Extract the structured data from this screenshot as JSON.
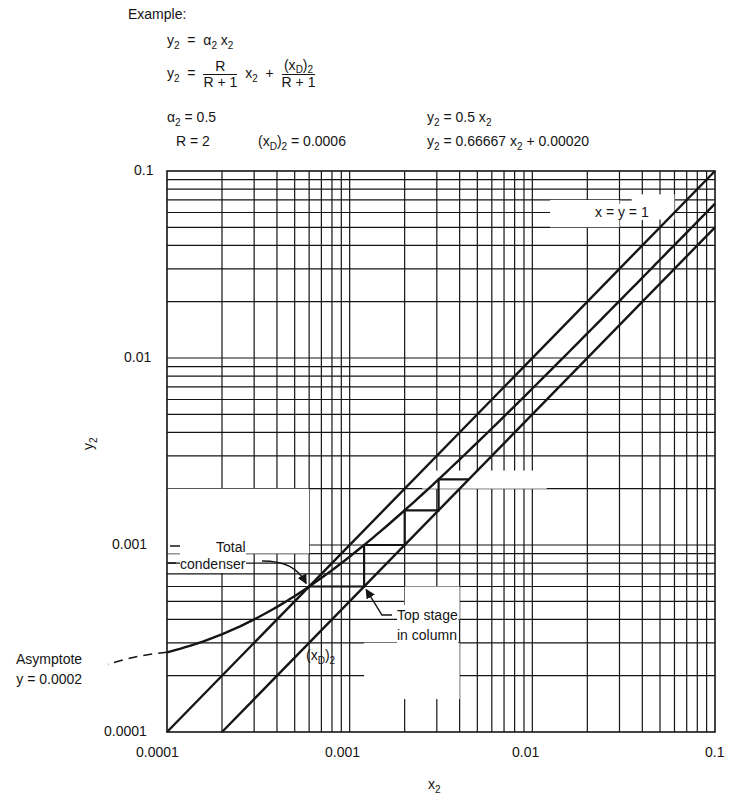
{
  "header": {
    "example_label": "Example:",
    "eq1": {
      "lhs": "y",
      "lhs_sub": "2",
      "eq": "=",
      "alpha": "α",
      "alpha_sub": "2",
      "x": "x",
      "x_sub": "2"
    },
    "eq2": {
      "lhs": "y",
      "lhs_sub": "2",
      "eq": "=",
      "frac1_num": "R",
      "frac1_den": "R + 1",
      "x": "x",
      "x_sub": "2",
      "plus": "+",
      "frac2_num_a": "(x",
      "frac2_num_sub": "D",
      "frac2_num_b": ")",
      "frac2_num_sub2": "2",
      "frac2_den": "R + 1"
    },
    "params": {
      "alpha_label": "α",
      "alpha_sub": "2",
      "alpha_value": "= 0.5",
      "r_text": "R  =  2",
      "xd_a": "(x",
      "xd_sub": "D",
      "xd_b": ")",
      "xd_sub2": "2",
      "xd_value": "= 0.0006"
    },
    "results": {
      "line1_lhs": "y",
      "line1_sub": "2",
      "line1_rhs": "= 0.5  x",
      "line1_rhs_sub": "2",
      "line2_lhs": "y",
      "line2_sub": "2",
      "line2_rhs": "= 0.66667  x",
      "line2_rhs_sub": "2",
      "line2_tail": " + 0.00020"
    }
  },
  "chart_data": {
    "type": "line",
    "title": "",
    "xlabel": "x2",
    "ylabel": "y2",
    "xscale": "log",
    "yscale": "log",
    "xlim": [
      0.0001,
      0.1
    ],
    "ylim": [
      0.0001,
      0.1
    ],
    "grid": true,
    "x_ticks": [
      "0.0001",
      "0.001",
      "0.01",
      "0.1"
    ],
    "y_ticks": [
      "0.0001",
      "0.001",
      "0.01",
      "0.1"
    ],
    "series": [
      {
        "name": "x = y = 1",
        "kind": "diagonal",
        "points": [
          [
            0.0001,
            0.0001
          ],
          [
            0.1,
            0.1
          ]
        ]
      },
      {
        "name": "Operating line y2 = 0.66667 x2 + 0.00020",
        "kind": "operating",
        "slope": 0.66667,
        "intercept": 0.0002,
        "x_range": [
          0.0001,
          0.1
        ]
      },
      {
        "name": "Equilibrium y2 = 0.5 x2",
        "kind": "equilibrium",
        "points": [
          [
            0.0002,
            0.0001
          ],
          [
            0.1,
            0.05
          ]
        ]
      },
      {
        "name": "Stages",
        "kind": "staircase",
        "points": [
          [
            0.0006,
            0.0006
          ],
          [
            0.0012,
            0.0006
          ],
          [
            0.0012,
            0.001
          ],
          [
            0.002,
            0.001
          ],
          [
            0.002,
            0.001533
          ],
          [
            0.003067,
            0.001533
          ],
          [
            0.003067,
            0.002244
          ],
          [
            0.0045,
            0.002244
          ]
        ]
      }
    ],
    "annotations": [
      {
        "text": "x = y = 1",
        "at": [
          0.045,
          0.063
        ]
      },
      {
        "text": "Total condenser",
        "points_to": [
          0.0006,
          0.0006
        ]
      },
      {
        "text": "Top stage in column",
        "points_to": [
          0.0012,
          0.0006
        ]
      },
      {
        "text": "(xD)2",
        "at": [
          0.001,
          0.00023
        ]
      },
      {
        "text": "Asymptote y = 0.0002",
        "at": [
          0.0001,
          0.00023
        ]
      }
    ]
  },
  "annotations": {
    "xy_label": "x = y = 1",
    "total_line1": "Total",
    "total_line2": "condenser",
    "top_line1": "Top stage",
    "top_line2": "in column",
    "xd_a": "(x",
    "xd_sub": "D",
    "xd_b": ")",
    "xd_sub2": "2",
    "asym_line1": "Asymptote",
    "asym_line2": "y = 0.0002"
  },
  "axes": {
    "x_ticks": [
      "0.0001",
      "0.001",
      "0.01",
      "0.1"
    ],
    "y_ticks": [
      "0.1",
      "0.01",
      "0.001",
      "0.0001"
    ],
    "xlabel": "x",
    "xlabel_sub": "2",
    "ylabel": "y",
    "ylabel_sub": "2"
  },
  "colors": {
    "ink": "#151515",
    "paper": "#ffffff"
  }
}
